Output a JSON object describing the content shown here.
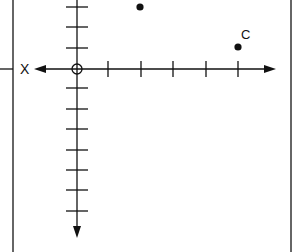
{
  "diagram": {
    "type": "coordinate-grid",
    "axis_label_left": "X",
    "point_labels": {
      "C": "C"
    },
    "points": [
      {
        "id": "B",
        "label": "",
        "x": 2,
        "y": 3,
        "px": 140,
        "py": 7
      },
      {
        "id": "C",
        "label": "C",
        "x": 5,
        "y": 1,
        "px": 238,
        "py": 47
      }
    ],
    "origin": {
      "px": 77,
      "py": 69,
      "marker": "open-circle"
    },
    "x_ticks_right": [
      108,
      141,
      173,
      206,
      238
    ],
    "y_ticks_up": [
      7,
      27,
      48
    ],
    "y_ticks_down": [
      88,
      109,
      129,
      150,
      170,
      190,
      211
    ],
    "colors": {
      "ink": "#111111",
      "background": "#ffffff",
      "frame": "#333333"
    }
  }
}
